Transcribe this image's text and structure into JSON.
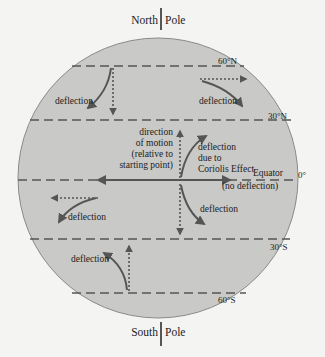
{
  "colors": {
    "background": "#f4f4f2",
    "globe_fill": "#c9c9c7",
    "globe_stroke": "#8a8a88",
    "line": "#555555",
    "text": "#222222"
  },
  "poles": {
    "north": {
      "left": "North",
      "right": "Pole"
    },
    "south": {
      "left": "South",
      "right": "Pole"
    }
  },
  "latitudes": {
    "n60": "60°N",
    "n30": "30°N",
    "equator_deg": "0°",
    "s30": "30°S",
    "s60": "60°S"
  },
  "equator": {
    "label": "Equator",
    "note": "(no deflection)"
  },
  "center_labels": {
    "direction": [
      "direction",
      "of motion",
      "(relative to",
      "starting point)"
    ],
    "coriolis": [
      "deflection",
      "due to",
      "Coriolis Effect"
    ]
  },
  "deflection_label": "deflection"
}
